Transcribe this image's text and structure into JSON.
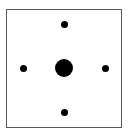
{
  "figure": {
    "canvas": {
      "width": 129,
      "height": 135,
      "background": "#ffffff"
    },
    "frame": {
      "name": "bounding-box",
      "x": 6,
      "y": 9,
      "width": 116,
      "height": 119,
      "border_width": 1.5,
      "border_color": "#5a5a5a",
      "fill": "#ffffff"
    },
    "dot_color": "#000000",
    "dots": [
      {
        "name": "center-dot",
        "role": "center",
        "cx": 64,
        "cy": 68,
        "diameter": 18
      },
      {
        "name": "top-dot",
        "role": "north",
        "cx": 64,
        "cy": 24,
        "diameter": 7
      },
      {
        "name": "right-dot",
        "role": "east",
        "cx": 105,
        "cy": 68,
        "diameter": 7
      },
      {
        "name": "bottom-dot",
        "role": "south",
        "cx": 64,
        "cy": 112,
        "diameter": 7
      },
      {
        "name": "left-dot",
        "role": "west",
        "cx": 23,
        "cy": 68,
        "diameter": 7
      }
    ]
  }
}
